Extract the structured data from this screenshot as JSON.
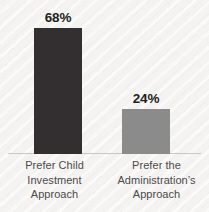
{
  "chart_data": {
    "type": "bar",
    "title": "",
    "subtitle": "",
    "xlabel": "",
    "ylabel": "",
    "ylim": [
      0,
      80
    ],
    "grid": false,
    "legend": false,
    "categories": [
      "Prefer Child Investment Approach",
      "Prefer the Administration’s Approach"
    ],
    "values": [
      68,
      24
    ],
    "value_labels": [
      "68%",
      "24%"
    ],
    "bar_colors": [
      "#332f31",
      "#8b8b8b"
    ],
    "background_color": "#f6f5f3",
    "baseline_color": "#c9c7c4",
    "label_color": "#4c4a4b",
    "value_label_color": "#231f20"
  },
  "bars": [
    {
      "value_label": "68%",
      "line1": "Prefer Child",
      "line2": "Investment",
      "line3": "Approach"
    },
    {
      "value_label": "24%",
      "line1": "Prefer the",
      "line2": "Administration’s",
      "line3": "Approach"
    }
  ]
}
